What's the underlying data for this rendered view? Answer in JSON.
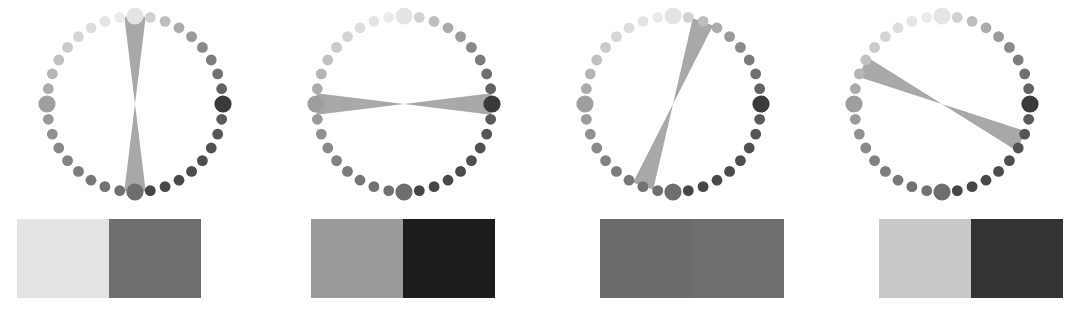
{
  "figure": {
    "type": "grayscale-color-wheel-comparison",
    "background": "#ffffff",
    "width": 1076,
    "height": 318,
    "panel_count": 4
  },
  "wheel_common": {
    "dot_count": 36,
    "radius": 88,
    "dot_radius_normal": 5.4,
    "dot_radius_large": 8.6,
    "large_dot_indices": [
      0,
      9,
      18,
      27
    ],
    "ramp_note": "grayscale ramp running from near-white at top, clockwise through dark at right, mid-gray at bottom, mid-light at left",
    "dot_colors": [
      "#e4e4e4",
      "#d0d0d0",
      "#bdbdbd",
      "#ababab",
      "#9a9a9a",
      "#8a8a8a",
      "#7c7c7c",
      "#6f6f6f",
      "#636363",
      "#3a3a3a",
      "#5a5a5a",
      "#555555",
      "#515151",
      "#4e4e4e",
      "#4b4b4b",
      "#494949",
      "#474747",
      "#464646",
      "#6e6e6e",
      "#707070",
      "#737373",
      "#777777",
      "#7c7c7c",
      "#828282",
      "#898989",
      "#919191",
      "#9a9a9a",
      "#9e9e9e",
      "#ababab",
      "#b5b5b5",
      "#c0c0c0",
      "#cacaca",
      "#d4d4d4",
      "#dcdcdc",
      "#e3e3e3",
      "#eaeaea"
    ],
    "bowtie_color": "#a8a8a8",
    "bowtie_half_width_deg": 7
  },
  "panels": [
    {
      "id": "panel-1",
      "label": "panel-1",
      "x": 0,
      "wheel": {
        "bowtie_angle_deg": 90,
        "bowtie_length_a": 88,
        "bowtie_length_b": 88
      },
      "bar": {
        "x": 17,
        "width": 184,
        "left_color": "#e3e3e3",
        "right_color": "#6e6e6e",
        "left_label": "very-light-gray",
        "right_label": "medium-dark-gray"
      }
    },
    {
      "id": "panel-2",
      "label": "panel-2",
      "x": 269,
      "wheel": {
        "bowtie_angle_deg": 0,
        "bowtie_length_a": 88,
        "bowtie_length_b": 88
      },
      "bar": {
        "x": 42,
        "width": 184,
        "left_color": "#9a9a9a",
        "right_color": "#1c1c1c",
        "left_label": "medium-gray",
        "right_label": "near-black"
      }
    },
    {
      "id": "panel-3",
      "label": "panel-3",
      "x": 538,
      "wheel": {
        "bowtie_angle_deg": 70,
        "bowtie_length_a": 88,
        "bowtie_length_b": 88
      },
      "bar": {
        "x": 62,
        "width": 184,
        "left_color": "#6b6b6b",
        "right_color": "#6e6e6e",
        "left_label": "medium-dark-gray",
        "right_label": "medium-dark-gray"
      }
    },
    {
      "id": "panel-4",
      "label": "panel-4",
      "x": 807,
      "wheel": {
        "bowtie_angle_deg": -25,
        "bowtie_length_a": 88,
        "bowtie_length_b": 88
      },
      "bar": {
        "x": 72,
        "width": 184,
        "left_color": "#c8c8c8",
        "right_color": "#333333",
        "left_label": "light-gray",
        "right_label": "dark-gray"
      }
    }
  ]
}
